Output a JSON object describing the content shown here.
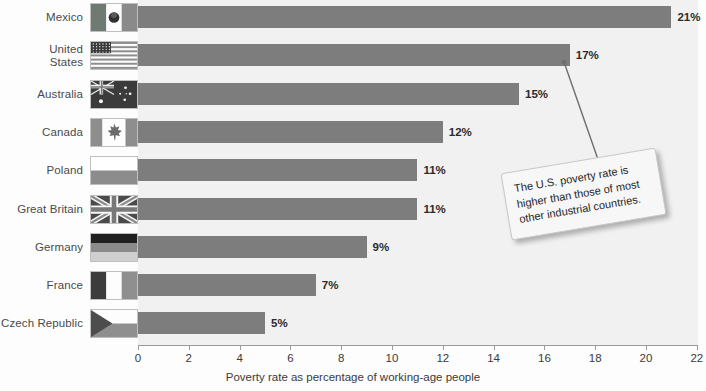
{
  "chart_data": {
    "type": "bar",
    "orientation": "horizontal",
    "title": "",
    "xlabel": "Poverty rate as percentage of working-age people",
    "ylabel": "",
    "xlim": [
      0,
      22
    ],
    "xticks": [
      0,
      2,
      4,
      6,
      8,
      10,
      12,
      14,
      16,
      18,
      20,
      22
    ],
    "grid": false,
    "legend": false,
    "bar_color": "#7d7d7d",
    "plot_background": "#f1f1f1",
    "categories": [
      "Mexico",
      "United States",
      "Australia",
      "Canada",
      "Poland",
      "Great Britain",
      "Germany",
      "France",
      "Czech Republic"
    ],
    "values": [
      21,
      17,
      15,
      12,
      11,
      11,
      9,
      7,
      5
    ],
    "data_labels": [
      "21%",
      "17%",
      "15%",
      "12%",
      "11%",
      "11%",
      "9%",
      "7%",
      "5%"
    ],
    "annotations": [
      {
        "text": "The U.S. poverty rate is higher than those of most other industrial countries.",
        "points_to_category": "United States",
        "points_to_value": 17
      }
    ]
  },
  "rows": [
    {
      "label": "Mexico",
      "flag": "flag-mexico",
      "value": 21,
      "data_label": "21%"
    },
    {
      "label": "United\nStates",
      "flag": "flag-united-states",
      "value": 17,
      "data_label": "17%"
    },
    {
      "label": "Australia",
      "flag": "flag-australia",
      "value": 15,
      "data_label": "15%"
    },
    {
      "label": "Canada",
      "flag": "flag-canada",
      "value": 12,
      "data_label": "12%"
    },
    {
      "label": "Poland",
      "flag": "flag-poland",
      "value": 11,
      "data_label": "11%"
    },
    {
      "label": "Great Britain",
      "flag": "flag-great-britain",
      "value": 11,
      "data_label": "11%"
    },
    {
      "label": "Germany",
      "flag": "flag-germany",
      "value": 9,
      "data_label": "9%"
    },
    {
      "label": "France",
      "flag": "flag-france",
      "value": 7,
      "data_label": "7%"
    },
    {
      "label": "Czech Republic",
      "flag": "flag-czech-republic",
      "value": 5,
      "data_label": "5%"
    }
  ],
  "axis": {
    "title": "Poverty rate as percentage of working-age people",
    "ticks": [
      "0",
      "2",
      "4",
      "6",
      "8",
      "10",
      "12",
      "14",
      "16",
      "18",
      "20",
      "22"
    ]
  },
  "callout": {
    "text": "The U.S. poverty rate is higher than those of most other industrial countries."
  }
}
